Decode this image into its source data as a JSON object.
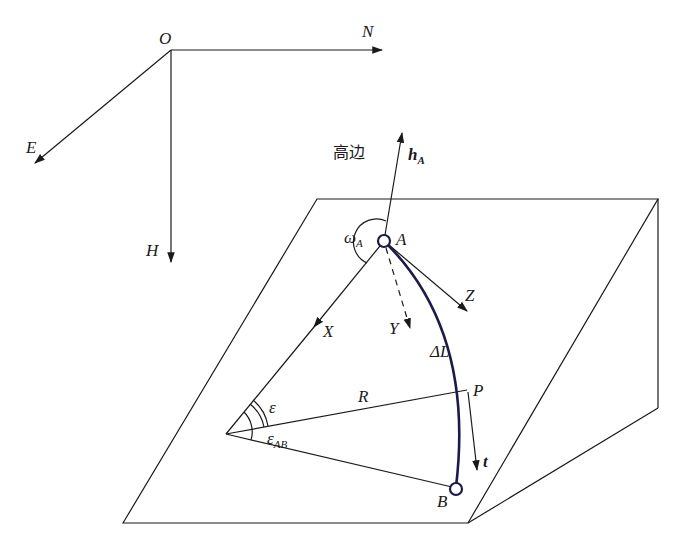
{
  "diagram": {
    "type": "well trajectory arc geometry on inclined plane",
    "colors": {
      "line": "#1a1a1a",
      "trajectory": "#1c1a4a",
      "background": "#ffffff"
    },
    "global_axes": {
      "origin": "O",
      "north": "N",
      "east": "E",
      "vertical": "H"
    },
    "high_side_label": "高边",
    "high_side_vector": {
      "main": "h",
      "sub": "A"
    },
    "toolface_angle": {
      "main": "ω",
      "sub": "A"
    },
    "points": {
      "A": "A",
      "B": "B",
      "P": "P"
    },
    "local_axes": {
      "x": "X",
      "y": "Y",
      "z": "Z"
    },
    "arc_length": "ΔL",
    "radius": "R",
    "angle_eps": "ε",
    "angle_eps_ab": {
      "main": "ε",
      "sub": "AB"
    },
    "tangent": "t"
  }
}
